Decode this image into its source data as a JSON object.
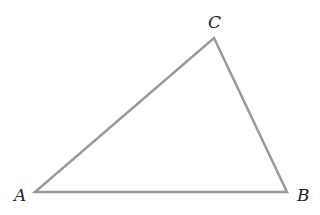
{
  "diagram": {
    "type": "triangle",
    "stroke_color": "#9a9a9a",
    "vertices": [
      {
        "label": "A",
        "x": 35,
        "y": 192,
        "label_x": 14,
        "label_y": 201
      },
      {
        "label": "B",
        "x": 287,
        "y": 192,
        "label_x": 297,
        "label_y": 201
      },
      {
        "label": "C",
        "x": 214,
        "y": 38,
        "label_x": 208,
        "label_y": 28
      }
    ]
  }
}
